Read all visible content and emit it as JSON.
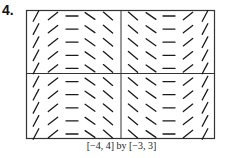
{
  "problem": {
    "number": "4."
  },
  "window_caption": "[−4, 4] by [−3, 3]",
  "chart_data": {
    "type": "slope_field",
    "title": "",
    "xlabel": "",
    "ylabel": "",
    "xlim": [
      -4,
      4
    ],
    "ylim": [
      -3,
      3
    ],
    "axes": {
      "x_axis_at_y": 0,
      "y_axis_at_x": 0
    },
    "columns": [
      {
        "x": -3.5,
        "slope_glyph": "steep positive",
        "angle_deg": 62
      },
      {
        "x": -2.5,
        "slope_glyph": "shallow positive",
        "angle_deg": 38
      },
      {
        "x": -1.5,
        "slope_glyph": "zero",
        "angle_deg": 0
      },
      {
        "x": -0.75,
        "slope_glyph": "shallow negative",
        "angle_deg": -35
      },
      {
        "x": -0.25,
        "slope_glyph": "steep negative",
        "angle_deg": -40
      },
      {
        "x": 0.25,
        "slope_glyph": "steep negative",
        "angle_deg": -40
      },
      {
        "x": 0.75,
        "slope_glyph": "shallow negative",
        "angle_deg": -35
      },
      {
        "x": 1.5,
        "slope_glyph": "zero",
        "angle_deg": 0
      },
      {
        "x": 2.5,
        "slope_glyph": "shallow positive",
        "angle_deg": 38
      },
      {
        "x": 3.5,
        "slope_glyph": "steep positive",
        "angle_deg": 62
      }
    ],
    "rows": 10,
    "note": "slopes depend only on x (same in every row)"
  },
  "colors": {
    "ink": "#1a1a1a",
    "frame": "#333333",
    "background": "#ffffff"
  }
}
